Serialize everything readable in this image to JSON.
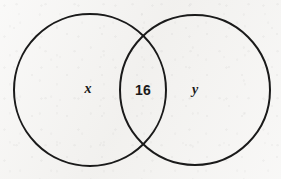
{
  "diagram": {
    "type": "venn-two-set",
    "background_color": "#f3f2f0",
    "stroke_color": "#1a1a1a",
    "stroke_width": 2,
    "canvas": {
      "width": 281,
      "height": 179
    },
    "circles": [
      {
        "id": "left-set",
        "cx": 90,
        "cy": 90,
        "r": 76
      },
      {
        "id": "right-set",
        "cx": 195,
        "cy": 90,
        "r": 75
      }
    ],
    "regions": [
      {
        "id": "left-only",
        "label": "x",
        "style": "italic",
        "cx": 88,
        "cy": 89
      },
      {
        "id": "intersection",
        "label": "16",
        "style": "normal",
        "cx": 143,
        "cy": 90
      },
      {
        "id": "right-only",
        "label": "y",
        "style": "italic",
        "cx": 195,
        "cy": 90
      }
    ]
  }
}
